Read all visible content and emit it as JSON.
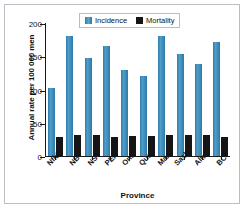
{
  "chart_data": {
    "type": "bar",
    "title": "",
    "xlabel": "Province",
    "ylabel": "Annual rate per 100 000 men",
    "categories": [
      "Nfld.",
      "NB",
      "NS",
      "PEI",
      "Ont.",
      "Que.",
      "Man.",
      "Sask.",
      "Alta.",
      "BC"
    ],
    "series": [
      {
        "name": "Incidence",
        "color": "#3d8bb8",
        "values": [
          103,
          180,
          148,
          165,
          129,
          120,
          181,
          154,
          139,
          171
        ]
      },
      {
        "name": "Mortality",
        "color": "#151515",
        "values": [
          29,
          31,
          31,
          29,
          30,
          30,
          32,
          31,
          31,
          29
        ]
      }
    ],
    "ylim": [
      0,
      200
    ],
    "yticks": [
      0,
      50,
      100,
      150,
      200
    ],
    "ytick_labels": [
      "0",
      "50",
      "100",
      "150",
      "200"
    ],
    "grid": false,
    "legend_position": "top-center"
  },
  "legend": {
    "items": [
      {
        "label": "Incidence",
        "swatch": "blue-square-icon"
      },
      {
        "label": "Mortality",
        "swatch": "black-square-icon"
      }
    ]
  }
}
